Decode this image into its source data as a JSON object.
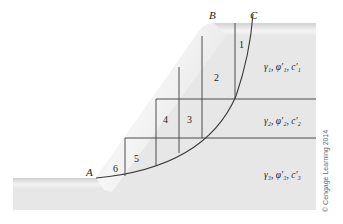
{
  "diagram": {
    "points": {
      "A": "A",
      "B": "B",
      "C": "C"
    },
    "slices": [
      "1",
      "2",
      "3",
      "4",
      "5",
      "6"
    ],
    "layers": [
      {
        "label": "γ₁, φ′₁, c′₁"
      },
      {
        "label": "γ₂, φ′₂, c′₂"
      },
      {
        "label": "γ₃, φ′₃, c′₃"
      }
    ],
    "copyright": "© Cengage Learning 2014",
    "colors": {
      "soil_fill": "#e6e6e6",
      "soil_highlight": "#f7f7f7",
      "line": "#3a3a3a",
      "background": "#ffffff"
    }
  }
}
